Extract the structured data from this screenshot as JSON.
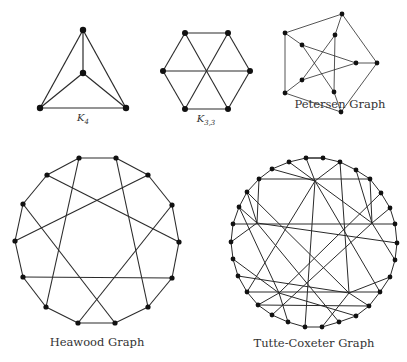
{
  "figure": {
    "graphs": [
      {
        "id": "k4",
        "label": "K",
        "label_sub": "4",
        "label_pos": [
          83,
          112
        ],
        "node_radius": 3.2,
        "edge_width": 1.2,
        "nodes": [
          [
            83,
            30
          ],
          [
            83,
            73
          ],
          [
            40,
            108
          ],
          [
            126,
            108
          ]
        ],
        "edges": [
          [
            0,
            1
          ],
          [
            0,
            2
          ],
          [
            0,
            3
          ],
          [
            1,
            2
          ],
          [
            1,
            3
          ],
          [
            2,
            3
          ]
        ]
      },
      {
        "id": "k33",
        "label": "K",
        "label_sub": "3,3",
        "label_pos": [
          206,
          113
        ],
        "node_radius": 3,
        "edge_width": 1.1,
        "nodes": [
          [
            185,
            33
          ],
          [
            228,
            33
          ],
          [
            250,
            71
          ],
          [
            228,
            109
          ],
          [
            185,
            109
          ],
          [
            163,
            71
          ]
        ],
        "edges": [
          [
            0,
            1
          ],
          [
            1,
            2
          ],
          [
            2,
            3
          ],
          [
            3,
            4
          ],
          [
            4,
            5
          ],
          [
            5,
            0
          ],
          [
            0,
            3
          ],
          [
            1,
            4
          ],
          [
            2,
            5
          ]
        ]
      },
      {
        "id": "petersen",
        "label": "Petersen Graph",
        "label_pos": [
          340,
          98
        ],
        "node_radius": 2.4,
        "edge_width": 0.8,
        "nodes": [
          [
            342,
            14
          ],
          [
            377,
            63
          ],
          [
            341,
            112
          ],
          [
            285,
            93
          ],
          [
            285,
            33
          ],
          [
            335,
            35
          ],
          [
            356,
            63
          ],
          [
            334,
            92
          ],
          [
            302,
            80
          ],
          [
            302,
            45
          ]
        ],
        "edges": [
          [
            0,
            1
          ],
          [
            1,
            2
          ],
          [
            2,
            3
          ],
          [
            3,
            4
          ],
          [
            4,
            0
          ],
          [
            0,
            5
          ],
          [
            1,
            6
          ],
          [
            2,
            7
          ],
          [
            3,
            8
          ],
          [
            4,
            9
          ],
          [
            5,
            8
          ],
          [
            5,
            7
          ],
          [
            9,
            6
          ],
          [
            9,
            7
          ],
          [
            6,
            8
          ]
        ]
      },
      {
        "id": "heawood",
        "label": "Heawood Graph",
        "label_pos": [
          97,
          336
        ],
        "node_radius": 2.6,
        "edge_width": 1.1,
        "nodes": [
          [
            79,
            158
          ],
          [
            116,
            158
          ],
          [
            148,
            175
          ],
          [
            172,
            205
          ],
          [
            179,
            242
          ],
          [
            172,
            278
          ],
          [
            148,
            307
          ],
          [
            115,
            323
          ],
          [
            78,
            323
          ],
          [
            46,
            307
          ],
          [
            23,
            277
          ],
          [
            15,
            241
          ],
          [
            23,
            204
          ],
          [
            47,
            175
          ]
        ],
        "edges": [
          [
            0,
            1
          ],
          [
            1,
            2
          ],
          [
            2,
            3
          ],
          [
            3,
            4
          ],
          [
            4,
            5
          ],
          [
            5,
            6
          ],
          [
            6,
            7
          ],
          [
            7,
            8
          ],
          [
            8,
            9
          ],
          [
            9,
            10
          ],
          [
            10,
            11
          ],
          [
            11,
            12
          ],
          [
            12,
            13
          ],
          [
            13,
            0
          ],
          [
            0,
            9
          ],
          [
            1,
            6
          ],
          [
            2,
            11
          ],
          [
            13,
            4
          ],
          [
            3,
            8
          ],
          [
            12,
            7
          ],
          [
            10,
            5
          ]
        ]
      },
      {
        "id": "tutte-coxeter",
        "label": "Tutte-Coxeter Graph",
        "label_pos": [
          314,
          337
        ],
        "node_radius": 2.4,
        "edge_width": 1.0,
        "outer_nodes": [
          [
            306,
            158
          ],
          [
            323,
            158
          ],
          [
            340,
            162
          ],
          [
            356,
            170
          ],
          [
            370,
            179
          ],
          [
            381,
            193
          ],
          [
            390,
            208
          ],
          [
            395,
            224
          ],
          [
            397,
            243
          ],
          [
            395,
            260
          ],
          [
            390,
            277
          ],
          [
            380,
            292
          ],
          [
            369,
            306
          ],
          [
            356,
            316
          ],
          [
            339,
            322
          ],
          [
            322,
            327
          ],
          [
            305,
            327
          ],
          [
            288,
            322
          ],
          [
            272,
            315
          ],
          [
            258,
            305
          ],
          [
            247,
            292
          ],
          [
            238,
            276
          ],
          [
            233,
            259
          ],
          [
            231,
            242
          ],
          [
            233,
            224
          ],
          [
            239,
            207
          ],
          [
            247,
            192
          ],
          [
            259,
            179
          ],
          [
            272,
            169
          ],
          [
            289,
            162
          ]
        ],
        "hubs": [
          [
            315,
            181
          ],
          [
            372,
            223
          ],
          [
            349,
            293
          ],
          [
            279,
            293
          ],
          [
            257,
            223
          ]
        ],
        "cycle_edges": true,
        "chords": [
          [
            27,
            4
          ],
          [
            24,
            7
          ],
          [
            20,
            11
          ],
          [
            19,
            12
          ],
          [
            0,
            1
          ]
        ],
        "hub_edges": [
          [
            0,
            0
          ],
          [
            0,
            2
          ],
          [
            0,
            28
          ],
          [
            0,
            16
          ],
          [
            0,
            11
          ],
          [
            0,
            20
          ],
          [
            1,
            4
          ],
          [
            1,
            6
          ],
          [
            1,
            9
          ],
          [
            1,
            18
          ],
          [
            1,
            29
          ],
          [
            1,
            3
          ],
          [
            2,
            10
          ],
          [
            2,
            12
          ],
          [
            2,
            15
          ],
          [
            2,
            26
          ],
          [
            2,
            2
          ],
          [
            2,
            21
          ],
          [
            3,
            17
          ],
          [
            3,
            19
          ],
          [
            3,
            22
          ],
          [
            3,
            5
          ],
          [
            3,
            25
          ],
          [
            3,
            13
          ],
          [
            4,
            23
          ],
          [
            4,
            25
          ],
          [
            4,
            26
          ],
          [
            4,
            8
          ],
          [
            4,
            14
          ],
          [
            4,
            27
          ]
        ]
      }
    ]
  }
}
